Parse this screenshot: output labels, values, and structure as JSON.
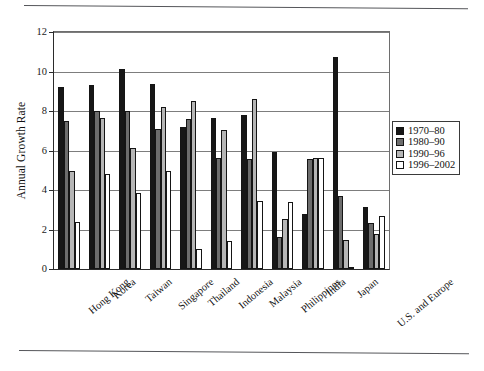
{
  "page": {
    "top_rule": "horizontal-rule",
    "bottom_rule": "horizontal-rule"
  },
  "chart_data": {
    "type": "bar",
    "title": "",
    "xlabel": "",
    "ylabel": "Annual Growth Rate",
    "ylim": [
      0,
      12
    ],
    "yticks": [
      0,
      2,
      4,
      6,
      8,
      10,
      12
    ],
    "ytick_labels": [
      "0",
      "2",
      "4",
      "6",
      "8",
      "10",
      "12"
    ],
    "grid": true,
    "legend_position": "right",
    "categories": [
      "Hong Kong",
      "Korea",
      "Taiwan",
      "Singapore",
      "Thailand",
      "Indonesia",
      "Malaysia",
      "Philippines",
      "India",
      "Japan",
      "U.S. and Europe"
    ],
    "series": [
      {
        "name": "1970–80",
        "color": "#171717",
        "values": [
          9.2,
          9.3,
          10.15,
          9.35,
          7.2,
          7.65,
          7.8,
          5.9,
          2.8,
          10.75,
          3.15
        ]
      },
      {
        "name": "1980–90",
        "color": "#6d6d6d",
        "values": [
          7.5,
          8.0,
          8.0,
          7.1,
          7.6,
          5.6,
          5.55,
          1.6,
          5.55,
          3.7,
          2.35
        ]
      },
      {
        "name": "1990–96",
        "color": "#b6b6b6",
        "values": [
          4.95,
          7.65,
          6.15,
          8.2,
          8.5,
          7.05,
          8.6,
          2.55,
          5.6,
          1.45,
          1.75
        ]
      },
      {
        "name": "1996–2002",
        "color": "#ffffff",
        "values": [
          2.4,
          4.8,
          3.85,
          4.95,
          1.0,
          1.4,
          3.45,
          3.4,
          5.6,
          0.1,
          2.7
        ]
      }
    ]
  }
}
